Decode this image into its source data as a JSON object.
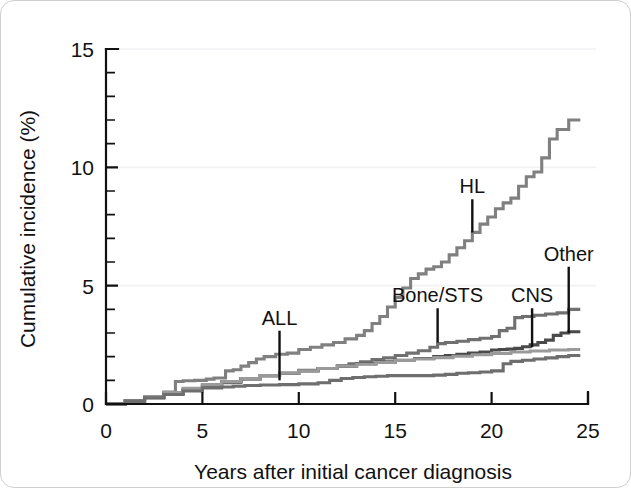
{
  "figure": {
    "background_color": "#ffffff",
    "border_color": "#cfcfcf"
  },
  "chart_data": {
    "type": "line",
    "title": "",
    "subtitle": "",
    "xlabel": "Years after initial cancer diagnosis",
    "ylabel": "Cumulative incidence (%)",
    "xlim": [
      0,
      25
    ],
    "ylim": [
      0,
      15
    ],
    "xticks": [
      0,
      5,
      10,
      15,
      20,
      25
    ],
    "yticks": [
      0,
      5,
      10,
      15
    ],
    "xtick_labels": [
      "0",
      "5",
      "10",
      "15",
      "20",
      "25"
    ],
    "ytick_labels": [
      "0",
      "5",
      "10",
      "15"
    ],
    "x_minor_tick_step": 1,
    "y_minor_tick_step": 1,
    "grid": "horizontal-faint",
    "legend": "none-inline-annotations",
    "step_style": "post",
    "series": [
      {
        "name": "HL",
        "color": "#808080",
        "x": [
          0,
          1.0,
          2.0,
          3.0,
          3.6,
          4.0,
          4.6,
          5.2,
          5.6,
          6.2,
          6.6,
          7.0,
          7.4,
          7.8,
          8.2,
          8.8,
          9.4,
          10.0,
          10.6,
          11.2,
          11.8,
          12.4,
          13.0,
          13.4,
          13.8,
          14.2,
          14.6,
          15.0,
          15.4,
          15.8,
          16.2,
          16.6,
          17.0,
          17.4,
          17.8,
          18.2,
          18.6,
          19.0,
          19.4,
          19.8,
          20.2,
          20.6,
          21.0,
          21.4,
          21.8,
          22.2,
          22.6,
          23.0,
          23.4,
          24.0,
          24.6
        ],
        "y": [
          0.0,
          0.14,
          0.3,
          0.5,
          0.95,
          0.98,
          1.0,
          1.05,
          1.1,
          1.4,
          1.45,
          1.6,
          1.75,
          1.9,
          2.0,
          2.1,
          2.15,
          2.3,
          2.4,
          2.5,
          2.6,
          2.75,
          2.9,
          3.1,
          3.4,
          3.7,
          4.1,
          4.5,
          4.9,
          5.3,
          5.5,
          5.7,
          5.8,
          6.0,
          6.3,
          6.6,
          6.9,
          7.25,
          7.6,
          7.9,
          8.25,
          8.5,
          8.7,
          9.2,
          9.6,
          9.8,
          10.4,
          11.2,
          11.6,
          12.0,
          12.0
        ]
      },
      {
        "name": "Bone/STS",
        "color": "#707070",
        "x": [
          0,
          1.0,
          2.0,
          3.0,
          4.0,
          5.0,
          6.0,
          7.0,
          8.0,
          9.0,
          10.0,
          11.0,
          12.0,
          12.6,
          13.2,
          13.8,
          14.4,
          15.0,
          15.6,
          16.2,
          16.8,
          17.2,
          17.6,
          18.2,
          18.8,
          19.4,
          20.0,
          20.4,
          20.8,
          21.2,
          21.6,
          22.2,
          22.8,
          23.4,
          24.0,
          24.6
        ],
        "y": [
          0.0,
          0.12,
          0.27,
          0.42,
          0.6,
          0.75,
          0.9,
          1.05,
          1.2,
          1.3,
          1.42,
          1.5,
          1.6,
          1.7,
          1.78,
          1.88,
          1.95,
          2.05,
          2.15,
          2.25,
          2.4,
          2.55,
          2.6,
          2.65,
          2.72,
          2.78,
          2.85,
          3.1,
          3.2,
          3.65,
          3.7,
          3.75,
          3.8,
          3.85,
          4.0,
          4.0
        ]
      },
      {
        "name": "CNS",
        "color": "#4a4a4a",
        "x": [
          0,
          1.0,
          2.0,
          3.0,
          4.0,
          5.0,
          6.0,
          7.0,
          8.0,
          9.0,
          10.0,
          11.0,
          12.0,
          13.0,
          14.0,
          15.0,
          16.0,
          17.0,
          17.6,
          18.2,
          18.8,
          19.4,
          20.0,
          20.4,
          20.8,
          21.2,
          21.6,
          22.0,
          22.4,
          22.8,
          23.2,
          23.6,
          24.0,
          24.6
        ],
        "y": [
          0.0,
          0.13,
          0.28,
          0.45,
          0.62,
          0.8,
          0.95,
          1.08,
          1.2,
          1.3,
          1.4,
          1.5,
          1.6,
          1.7,
          1.78,
          1.85,
          1.92,
          2.0,
          2.05,
          2.1,
          2.15,
          2.2,
          2.28,
          2.3,
          2.32,
          2.35,
          2.42,
          2.5,
          2.6,
          2.7,
          2.9,
          3.0,
          3.05,
          3.05
        ]
      },
      {
        "name": "ALL",
        "color": "#9a9a9a",
        "x": [
          0,
          1.0,
          2.0,
          3.0,
          4.0,
          5.0,
          6.0,
          7.0,
          8.0,
          9.0,
          10.0,
          11.0,
          12.0,
          13.0,
          14.0,
          15.0,
          16.0,
          17.0,
          18.0,
          19.0,
          20.0,
          21.0,
          22.0,
          23.0,
          24.0,
          24.6
        ],
        "y": [
          0.0,
          0.14,
          0.3,
          0.48,
          0.66,
          0.82,
          0.95,
          1.08,
          1.2,
          1.3,
          1.4,
          1.5,
          1.6,
          1.68,
          1.76,
          1.84,
          1.9,
          1.96,
          2.02,
          2.08,
          2.14,
          2.2,
          2.24,
          2.28,
          2.3,
          2.3
        ]
      },
      {
        "name": "Other",
        "color": "#6e6e6e",
        "x": [
          0,
          1.0,
          2.0,
          3.0,
          4.0,
          5.0,
          6.0,
          6.6,
          7.2,
          8.0,
          9.0,
          10.0,
          11.0,
          11.6,
          12.2,
          12.8,
          13.4,
          14.0,
          14.6,
          15.2,
          15.8,
          16.4,
          17.0,
          17.6,
          18.2,
          18.8,
          19.4,
          20.0,
          20.6,
          21.0,
          21.6,
          22.2,
          22.8,
          23.4,
          24.0,
          24.6
        ],
        "y": [
          0.0,
          0.12,
          0.26,
          0.4,
          0.55,
          0.68,
          0.72,
          0.75,
          0.78,
          0.8,
          0.82,
          0.85,
          0.9,
          1.0,
          1.08,
          1.12,
          1.15,
          1.17,
          1.2,
          1.2,
          1.2,
          1.2,
          1.22,
          1.25,
          1.3,
          1.32,
          1.35,
          1.4,
          1.7,
          1.8,
          1.85,
          1.9,
          1.95,
          2.0,
          2.05,
          2.05
        ]
      }
    ],
    "annotations": [
      {
        "label": "ALL",
        "text_x": 9.0,
        "text_y": 3.35,
        "tip_x": 9.0,
        "tip_y": 1.0
      },
      {
        "label": "Bone/STS",
        "text_x": 17.2,
        "text_y": 4.3,
        "tip_x": 17.2,
        "tip_y": 2.6
      },
      {
        "label": "HL",
        "text_x": 19.0,
        "text_y": 8.9,
        "tip_x": 19.0,
        "tip_y": 7.25
      },
      {
        "label": "CNS",
        "text_x": 22.1,
        "text_y": 4.3,
        "tip_x": 22.1,
        "tip_y": 2.4
      },
      {
        "label": "Other",
        "text_x": 24.0,
        "text_y": 6.05,
        "tip_x": 24.0,
        "tip_y": 3.0
      }
    ]
  }
}
